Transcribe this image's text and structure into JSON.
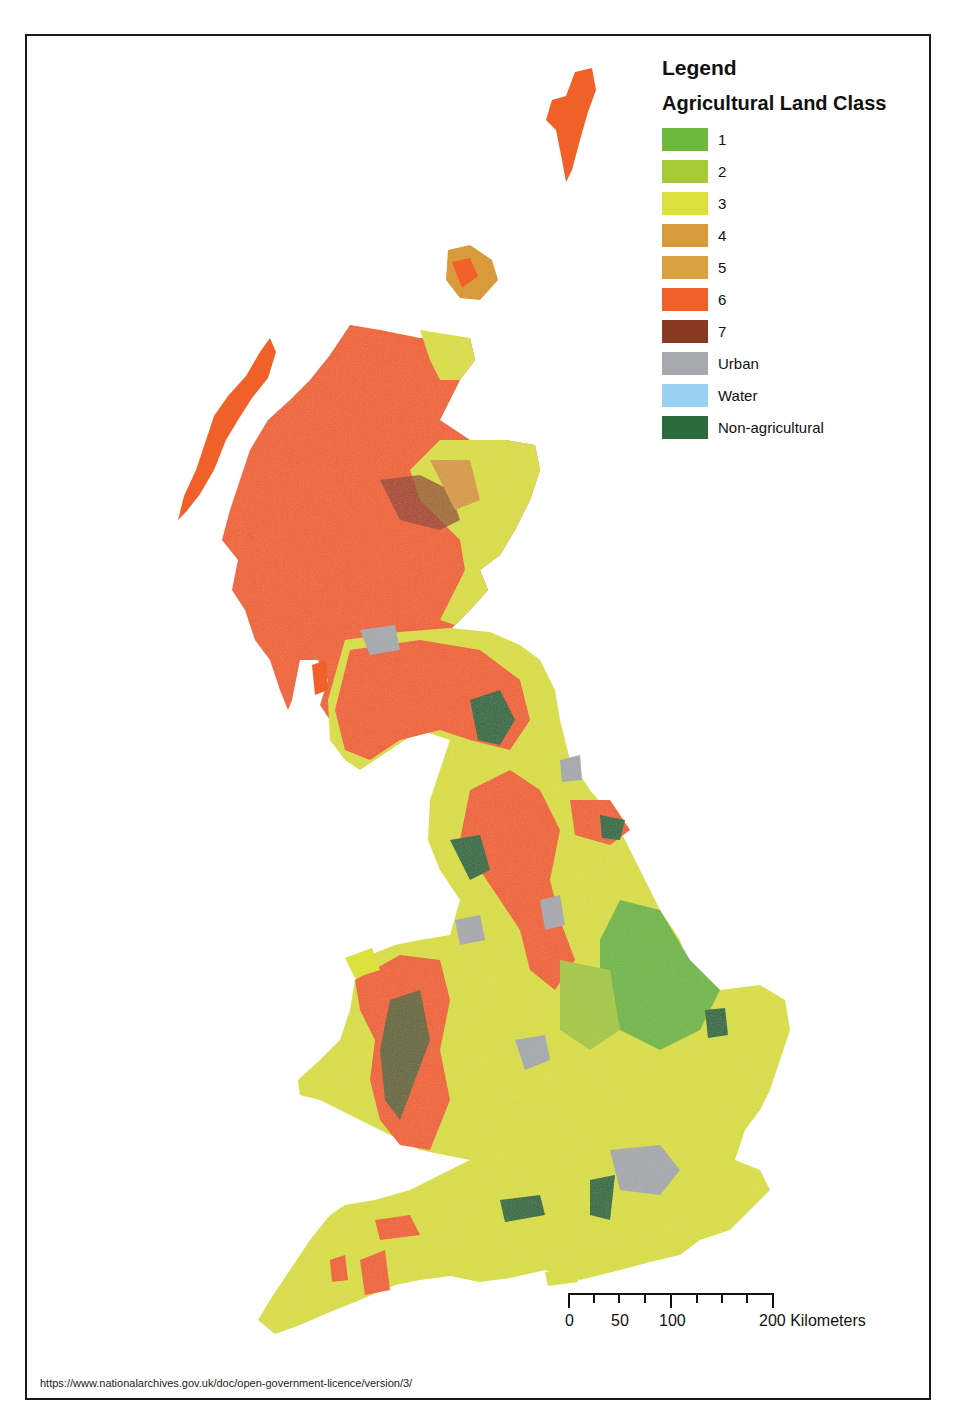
{
  "legend": {
    "title": "Legend",
    "subtitle": "Agricultural Land Class",
    "items": [
      {
        "label": "1",
        "color": "#6fb83f"
      },
      {
        "label": "2",
        "color": "#a6c93a"
      },
      {
        "label": "3",
        "color": "#dbe03a"
      },
      {
        "label": "4",
        "color": "#d99a3c"
      },
      {
        "label": "5",
        "color": "#dba040"
      },
      {
        "label": "6",
        "color": "#f2602a"
      },
      {
        "label": "7",
        "color": "#8b3a22"
      },
      {
        "label": "Urban",
        "color": "#a8a8b0"
      },
      {
        "label": "Water",
        "color": "#9ad0f2"
      },
      {
        "label": "Non-agricultural",
        "color": "#2b6a3a"
      }
    ]
  },
  "scalebar": {
    "ticks": [
      "0",
      "50",
      "100",
      "200 Kilometers"
    ],
    "unit": "Kilometers"
  },
  "licence_text": "https://www.nationalarchives.gov.uk/doc/open-government-licence/version/3/",
  "map": {
    "subject": "Great Britain agricultural land classification",
    "dominant_classes": {
      "scotland_highlands": "6",
      "east_scotland_lowlands": "3",
      "northern_england_uplands": "6",
      "wales": "6",
      "east_anglia": "1",
      "south_england": "3",
      "london": "Urban"
    }
  }
}
